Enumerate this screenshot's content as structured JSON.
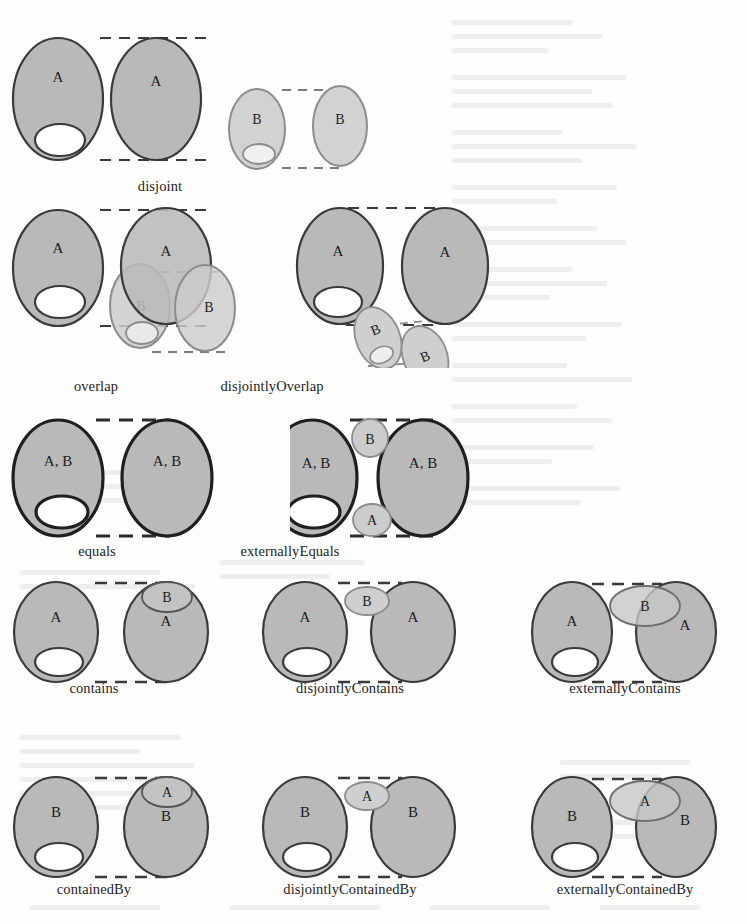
{
  "figure": {
    "title": "",
    "background_color": "#fdfdfc",
    "ink_color": "#232323",
    "colors": {
      "region_a_fill": "#b9b9b9",
      "region_a_stroke": "#3a3a3a",
      "region_b_fill": "#d2d2d2",
      "region_b_stroke": "#8c8c8c",
      "hole_fill": "#ffffff",
      "dashed_line": "#3a3a3a",
      "label_text": "#1d1d1d"
    },
    "region_labels": {
      "a": "A",
      "b": "B",
      "ab": "A, B"
    },
    "rows": [
      {
        "row_index": 0,
        "cells": [
          {
            "name": "disjoint",
            "label": "disjoint",
            "label_x": 160,
            "label_y": 178,
            "left_region_label": "A",
            "right_region_label": "A",
            "second_pair_left_label": "B",
            "second_pair_right_label": "B",
            "has_second_pair": true
          }
        ]
      },
      {
        "row_index": 1,
        "cells": [
          {
            "name": "overlap",
            "label": "overlap",
            "label_x": 96,
            "label_y": 378,
            "left_region_label": "A",
            "right_region_label": "A",
            "second_pair_left_label": "B",
            "second_pair_right_label": "B",
            "has_second_pair": true
          },
          {
            "name": "disjointlyOverlap",
            "label": "disjointlyOverlap",
            "label_x": 272,
            "label_y": 378,
            "left_region_label": "A",
            "right_region_label": "A",
            "second_pair_left_label": "B",
            "second_pair_right_label": "B",
            "has_second_pair": true
          }
        ]
      },
      {
        "row_index": 2,
        "cells": [
          {
            "name": "equals",
            "label": "equals",
            "label_x": 97,
            "label_y": 543,
            "left_region_label": "A, B",
            "right_region_label": "A, B",
            "has_second_pair": false
          },
          {
            "name": "externallyEquals",
            "label": "externallyEquals",
            "label_x": 290,
            "label_y": 543,
            "left_region_label": "A, B",
            "right_region_label": "A, B",
            "satellite_top_label": "B",
            "satellite_bottom_label": "A",
            "has_second_pair": false
          }
        ]
      },
      {
        "row_index": 3,
        "cells": [
          {
            "name": "contains",
            "label": "contains",
            "label_x": 94,
            "label_y": 680,
            "left_region_label": "A",
            "right_region_label": "A",
            "inner_label": "B",
            "has_second_pair": false
          },
          {
            "name": "disjointlyContains",
            "label": "disjointlyContains",
            "label_x": 350,
            "label_y": 680,
            "left_region_label": "A",
            "right_region_label": "A",
            "satellite_label": "B",
            "has_second_pair": false
          },
          {
            "name": "externallyContains",
            "label": "externallyContains",
            "label_x": 625,
            "label_y": 680,
            "left_region_label": "A",
            "right_region_label": "A",
            "straddle_label": "B",
            "has_second_pair": false
          }
        ]
      },
      {
        "row_index": 4,
        "cells": [
          {
            "name": "containedBy",
            "label": "containedBy",
            "label_x": 94,
            "label_y": 881,
            "left_region_label": "B",
            "right_region_label": "B",
            "inner_label": "A",
            "has_second_pair": false
          },
          {
            "name": "disjointlyContainedBy",
            "label": "disjointlyContainedBy",
            "label_x": 350,
            "label_y": 881,
            "left_region_label": "B",
            "right_region_label": "B",
            "satellite_label": "A",
            "has_second_pair": false
          },
          {
            "name": "externallyContainedBy",
            "label": "externallyContainedBy",
            "label_x": 625,
            "label_y": 881,
            "left_region_label": "B",
            "right_region_label": "B",
            "straddle_label": "A",
            "has_second_pair": false
          }
        ]
      }
    ]
  }
}
